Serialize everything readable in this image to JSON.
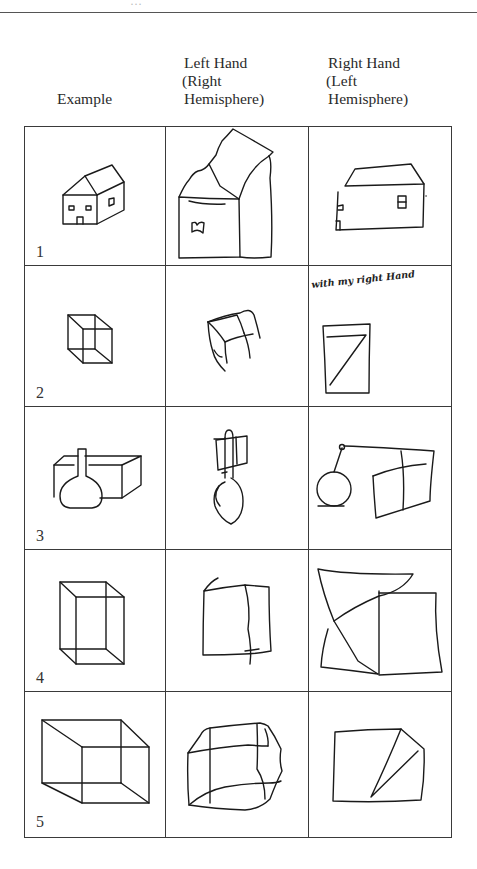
{
  "page": {
    "cutoff_heading": "…",
    "columns": [
      {
        "id": "example",
        "lines": [
          "Example"
        ]
      },
      {
        "id": "left_hand",
        "lines": [
          "Left Hand",
          "(Right",
          " Hemisphere)"
        ]
      },
      {
        "id": "right_hand",
        "lines": [
          "Right Hand",
          "(Left",
          " Hemisphere)"
        ]
      }
    ],
    "rows": [
      {
        "number": "1",
        "subject": "house",
        "example": "house drawing",
        "left_hand": "distorted house drawing",
        "right_hand": "flattened house drawing"
      },
      {
        "number": "2",
        "subject": "cube",
        "example": "wire-frame cube drawing",
        "left_hand": "distorted cube drawing",
        "right_hand": "flat rectangle drawing",
        "right_hand_annotation": "with my right Hand"
      },
      {
        "number": "3",
        "subject": "flask and box",
        "example": "flask in front of box drawing",
        "left_hand": "flask with stacked box drawing",
        "right_hand": "flask beside box drawing"
      },
      {
        "number": "4",
        "subject": "rectangular prism",
        "example": "tall box drawing",
        "left_hand": "square with crossing line drawing",
        "right_hand": "overlapping planes drawing"
      },
      {
        "number": "5",
        "subject": "room box",
        "example": "open box drawing",
        "left_hand": "irregular box drawing",
        "right_hand": "rectangle with wedge drawing"
      }
    ]
  }
}
